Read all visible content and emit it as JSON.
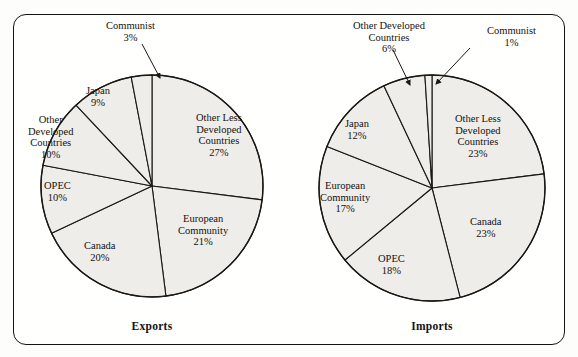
{
  "figure": {
    "cut_caption": "",
    "frame_color": "#16140f",
    "slice_fill": "#eeedea",
    "slice_stroke": "#1a1814"
  },
  "charts": [
    {
      "title": "Exports",
      "center": {
        "x": 152,
        "y": 186
      },
      "radius": 111,
      "labels": [
        {
          "name": "other-less-developed-countries",
          "text": "Other Less\nDeveloped\nCountries\n27%",
          "x": 196,
          "y": 112
        },
        {
          "name": "european-community",
          "text": "European\nCommunity\n21%",
          "x": 178,
          "y": 213
        },
        {
          "name": "canada",
          "text": "Canada\n20%",
          "x": 84,
          "y": 240
        },
        {
          "name": "opec",
          "text": "OPEC\n10%",
          "x": 44,
          "y": 180
        },
        {
          "name": "other-developed-countries",
          "text": "Other\nDeveloped\nCountries\n10%",
          "x": 28,
          "y": 114
        },
        {
          "name": "japan",
          "text": "Japan\n9%",
          "x": 86,
          "y": 85
        },
        {
          "name": "communist",
          "text": "Communist\n3%",
          "x": 106,
          "y": 20
        }
      ]
    },
    {
      "title": "Imports",
      "center": {
        "x": 432,
        "y": 188
      },
      "radius": 113,
      "labels": [
        {
          "name": "other-less-developed-countries",
          "text": "Other Less\nDeveloped\nCountries\n23%",
          "x": 455,
          "y": 113
        },
        {
          "name": "canada",
          "text": "Canada\n23%",
          "x": 470,
          "y": 216
        },
        {
          "name": "opec",
          "text": "OPEC\n18%",
          "x": 378,
          "y": 253
        },
        {
          "name": "european-community",
          "text": "European\nCommunity\n17%",
          "x": 320,
          "y": 180
        },
        {
          "name": "japan",
          "text": "Japan\n12%",
          "x": 345,
          "y": 118
        },
        {
          "name": "other-developed-countries",
          "text": "Other Developed\nCountries\n6%",
          "x": 353,
          "y": 20
        },
        {
          "name": "communist",
          "text": "Communist\n1%",
          "x": 487,
          "y": 25
        }
      ]
    }
  ],
  "chart_data": [
    {
      "type": "pie",
      "title": "Exports",
      "categories": [
        "Other Less Developed Countries",
        "European Community",
        "Canada",
        "OPEC",
        "Other Developed Countries",
        "Japan",
        "Communist"
      ],
      "values": [
        27,
        21,
        20,
        10,
        10,
        9,
        3
      ],
      "value_unit": "%",
      "value_labels": [
        "27%",
        "21%",
        "20%",
        "10%",
        "10%",
        "9%",
        "3%"
      ],
      "start_angle_deg": -90,
      "direction": "clockwise",
      "legend": "none",
      "labels_position": "inside-slice",
      "callouts": [
        "Communist"
      ],
      "xlabel": "",
      "ylabel": ""
    },
    {
      "type": "pie",
      "title": "Imports",
      "categories": [
        "Other Less Developed Countries",
        "Canada",
        "OPEC",
        "European Community",
        "Japan",
        "Other Developed Countries",
        "Communist"
      ],
      "values": [
        23,
        23,
        18,
        17,
        12,
        6,
        1
      ],
      "value_unit": "%",
      "value_labels": [
        "23%",
        "23%",
        "18%",
        "17%",
        "12%",
        "6%",
        "1%"
      ],
      "start_angle_deg": -90,
      "direction": "clockwise",
      "legend": "none",
      "labels_position": "inside-slice",
      "callouts": [
        "Other Developed Countries",
        "Communist"
      ],
      "xlabel": "",
      "ylabel": ""
    }
  ]
}
